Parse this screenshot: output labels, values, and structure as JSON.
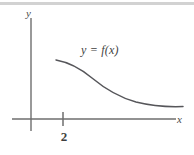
{
  "figure": {
    "background_color": "#ffffff",
    "top_band_color": "#d2d2d2",
    "axis_color": "#6e6e6e",
    "curve_color": "#56565a",
    "text_color": "#3f3f3f"
  },
  "axes": {
    "y_axis_label": "y",
    "x_axis_label": "x",
    "origin_px": {
      "x": 31,
      "y": 119
    },
    "x_axis_extent_px": {
      "from": 12,
      "to": 176
    },
    "y_axis_extent_px": {
      "from": 18,
      "to": 131
    }
  },
  "ticks": {
    "x": [
      {
        "label": "2",
        "value": 2,
        "px_x": 63
      }
    ],
    "y": []
  },
  "curve": {
    "label": "y = f(x)",
    "shape": "decreasing-sigmoid",
    "start_px": {
      "x": 56,
      "y": 60
    },
    "end_px": {
      "x": 183,
      "y": 106
    },
    "path": "M 56 60 C 70 62.5, 80 68, 92 78 C 104 88, 118 97, 136 102 C 152 106, 170 107, 183 106.5"
  },
  "chart_data": {
    "type": "line",
    "title": "",
    "subtitle": "",
    "xlabel": "x",
    "ylabel": "y",
    "grid": false,
    "legend_position": "none",
    "annotations": [
      {
        "text": "y = f(x)",
        "x_px": 81,
        "y_px": 44
      },
      {
        "text": "2",
        "x_px": 63,
        "y_px": 136
      }
    ],
    "axis_ticks": {
      "x": [
        "2"
      ],
      "y": []
    },
    "series": [
      {
        "name": "y = f(x)",
        "x": [
          56,
          68,
          80,
          92,
          104,
          116,
          128,
          140,
          152,
          164,
          176,
          183
        ],
        "values": [
          60,
          62,
          67,
          75,
          84,
          92,
          98,
          102,
          104.5,
          106,
          106.5,
          106.5
        ],
        "note": "pixel coordinates; y increases downward in image space"
      }
    ]
  }
}
